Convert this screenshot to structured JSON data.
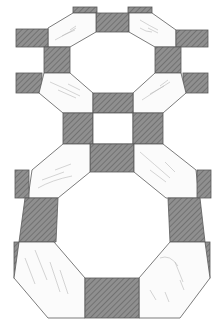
{
  "figure": {
    "labels": {
      "left_top": "3",
      "right_top": "4"
    },
    "colors": {
      "background": "#ffffff",
      "dark_tile": "#8c8c8c",
      "dark_tile_hatch": "#6e6e6e",
      "light_tile": "#fbfbfb",
      "outline": "#5a5a5a",
      "marble_streak": "#b5b5b5",
      "label": "#8a8a8a"
    }
  }
}
